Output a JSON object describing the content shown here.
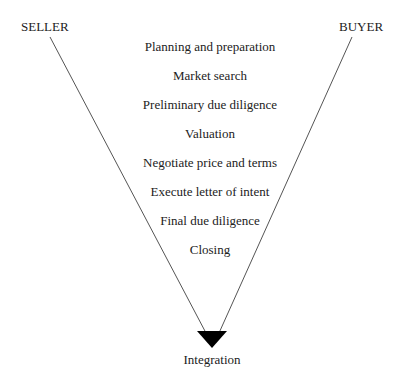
{
  "diagram": {
    "left_label": "SELLER",
    "right_label": "BUYER",
    "stages": [
      "Planning and preparation",
      "Market search",
      "Preliminary due diligence",
      "Valuation",
      "Negotiate price and terms",
      "Execute letter of intent",
      "Final due diligence",
      "Closing"
    ],
    "end_label": "Integration",
    "colors": {
      "line": "#555555",
      "arrow": "#000000",
      "text": "#222222"
    }
  }
}
